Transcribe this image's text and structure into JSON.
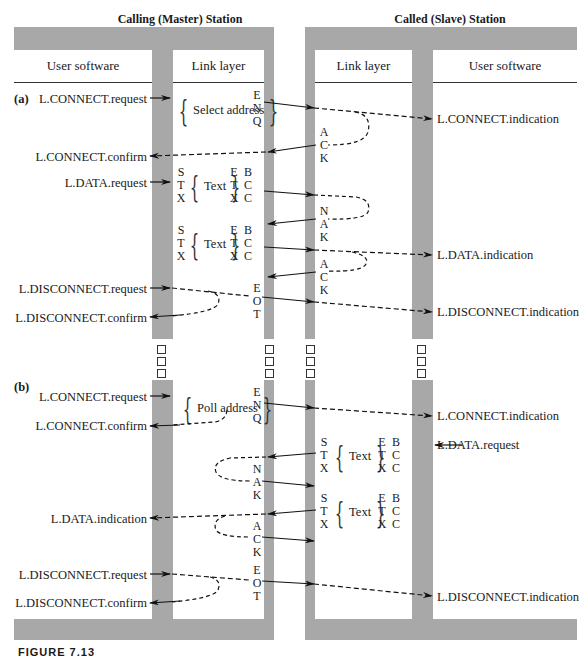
{
  "stations": {
    "master": {
      "title": "Calling (Master) Station",
      "columns": [
        "User software",
        "Link layer"
      ]
    },
    "slave": {
      "title": "Called (Slave) Station",
      "columns": [
        "Link layer",
        "User software"
      ]
    }
  },
  "part_a": {
    "label": "(a)",
    "master_user": {
      "connect_request": "L.CONNECT.request",
      "connect_confirm": "L.CONNECT.confirm",
      "data_request": "L.DATA.request",
      "disconnect_request": "L.DISCONNECT.request",
      "disconnect_confirm": "L.DISCONNECT.confirm"
    },
    "slave_user": {
      "connect_indication": "L.CONNECT.indication",
      "data_indication": "L.DATA.indication",
      "disconnect_indication": "L.DISCONNECT.indication"
    },
    "frames": {
      "select": {
        "content": "Select address",
        "control": [
          "E",
          "N",
          "Q"
        ]
      },
      "data1": {
        "start": [
          "S",
          "T",
          "X"
        ],
        "content": "Text",
        "end": [
          "E",
          "T",
          "X"
        ],
        "bcc": [
          "B",
          "C",
          "C"
        ]
      },
      "data2": {
        "start": [
          "S",
          "T",
          "X"
        ],
        "content": "Text",
        "end": [
          "E",
          "T",
          "X"
        ],
        "bcc": [
          "B",
          "C",
          "C"
        ]
      },
      "eot": [
        "E",
        "O",
        "T"
      ]
    },
    "slave_responses": {
      "ack1": [
        "A",
        "C",
        "K"
      ],
      "nak": [
        "N",
        "A",
        "K"
      ],
      "ack2": [
        "A",
        "C",
        "K"
      ]
    }
  },
  "part_b": {
    "label": "(b)",
    "master_user": {
      "connect_request": "L.CONNECT.request",
      "connect_confirm": "L.CONNECT.confirm",
      "data_indication": "L.DATA.indication",
      "disconnect_request": "L.DISCONNECT.request",
      "disconnect_confirm": "L.DISCONNECT.confirm"
    },
    "slave_user": {
      "connect_indication": "L.CONNECT.indication",
      "data_request": "L.DATA.request",
      "disconnect_indication": "L.DISCONNECT.indication"
    },
    "frames": {
      "poll": {
        "content": "Poll address",
        "control": [
          "E",
          "N",
          "Q"
        ]
      },
      "nak": [
        "N",
        "A",
        "K"
      ],
      "ack": [
        "A",
        "C",
        "K"
      ],
      "eot": [
        "E",
        "O",
        "T"
      ]
    },
    "slave_frames": {
      "data1": {
        "start": [
          "S",
          "T",
          "X"
        ],
        "content": "Text",
        "end": [
          "E",
          "T",
          "X"
        ],
        "bcc": [
          "B",
          "C",
          "C"
        ]
      },
      "data2": {
        "start": [
          "S",
          "T",
          "X"
        ],
        "content": "Text",
        "end": [
          "E",
          "T",
          "X"
        ],
        "bcc": [
          "B",
          "C",
          "C"
        ]
      }
    }
  },
  "continuation_marks": "□",
  "figure_caption": "FIGURE 7.13"
}
